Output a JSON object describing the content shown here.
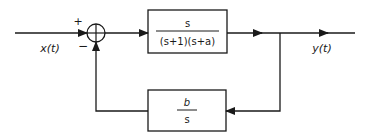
{
  "diagram": {
    "type": "feedback-control-block-diagram",
    "input_label": "x(t)",
    "output_label": "y(t)",
    "summing_junction": {
      "plus_sign": "+",
      "minus_sign": "−",
      "symbol": "+"
    },
    "forward_block": {
      "numerator": "s",
      "denominator": "(s+1)(s+a)"
    },
    "feedback_block": {
      "numerator": "b",
      "denominator": "s"
    },
    "colors": {
      "line": "#1a1a1a",
      "background": "#ffffff"
    }
  }
}
